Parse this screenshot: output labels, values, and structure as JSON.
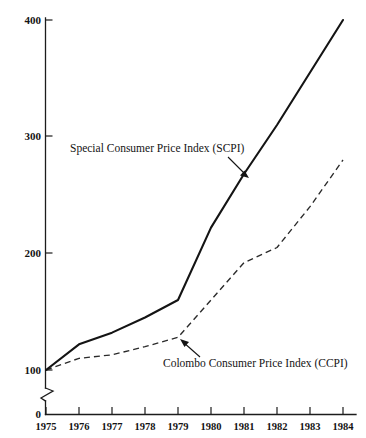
{
  "chart_data": {
    "type": "line",
    "title": "",
    "subtitle": "",
    "xlabel": "",
    "ylabel": "",
    "x": [
      1975,
      1976,
      1977,
      1978,
      1979,
      1980,
      1981,
      1982,
      1983,
      1984
    ],
    "categories": [
      "1975",
      "1976",
      "1977",
      "1978",
      "1979",
      "1980",
      "1981",
      "1982",
      "1983",
      "1984"
    ],
    "series": [
      {
        "name": "Special Consumer Price Index (SCPI)",
        "style": "solid",
        "color": "#141414",
        "values": [
          100,
          122,
          132,
          145,
          160,
          222,
          268,
          310,
          355,
          400
        ]
      },
      {
        "name": "Colombo Consumer Price Index (CCPI)",
        "style": "dashed",
        "color": "#2a2a2a",
        "values": [
          100,
          110,
          113,
          120,
          128,
          160,
          192,
          205,
          240,
          280
        ]
      }
    ],
    "ylim": [
      0,
      400
    ],
    "xlim": [
      1975,
      1984
    ],
    "y_ticks": [
      0,
      100,
      200,
      300,
      400
    ],
    "y_tick_labels": [
      "0",
      "100",
      "200",
      "300",
      "400"
    ],
    "x_ticks": [
      1975,
      1976,
      1977,
      1978,
      1979,
      1980,
      1981,
      1982,
      1983,
      1984
    ],
    "grid": false,
    "legend": "none",
    "axis_break": {
      "axis": "y",
      "between": [
        0,
        100
      ],
      "symbol": "zigzag"
    },
    "annotations": [
      {
        "text": "Special Consumer Price Index (SCPI)",
        "text_x": 70,
        "text_y": 152,
        "anchor": "start",
        "arrow_from_x": 228,
        "arrow_from_y": 157,
        "arrow_to_x": 248,
        "arrow_to_y": 177,
        "target_series": "Special Consumer Price Index (SCPI)"
      },
      {
        "text": "Colombo Consumer Price Index (CCPI)",
        "text_x": 163,
        "text_y": 367,
        "anchor": "start",
        "arrow_from_x": 199,
        "arrow_from_y": 356,
        "arrow_to_x": 180,
        "arrow_to_y": 340,
        "target_series": "Colombo Consumer Price Index (CCPI)"
      }
    ]
  },
  "axis_labels": {
    "y": {
      "t400": "400",
      "t300": "300",
      "t200": "200",
      "t100": "100",
      "t0": "0"
    },
    "x": {
      "y1975": "1975",
      "y1976": "1976",
      "y1977": "1977",
      "y1978": "1978",
      "y1979": "1979",
      "y1980": "1980",
      "y1981": "1981",
      "y1982": "1982",
      "y1983": "1983",
      "y1984": "1984"
    }
  },
  "annotation_text": {
    "scpi": "Special Consumer Price Index (SCPI)",
    "ccpi": "Colombo Consumer Price Index (CCPI)"
  }
}
